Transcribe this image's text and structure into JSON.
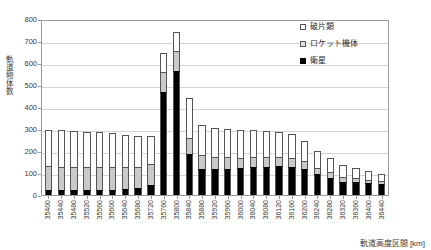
{
  "chart_data": {
    "type": "bar",
    "stacked": true,
    "title": "",
    "xlabel": "軌道高度区間 [km]",
    "ylabel": "軌道物体数",
    "ylim": [
      0,
      800
    ],
    "ytick_step": 100,
    "yticks": [
      0,
      100,
      200,
      300,
      400,
      500,
      600,
      700,
      800
    ],
    "grid": true,
    "legend_position": "top-right",
    "categories": [
      "35400",
      "35440",
      "35480",
      "35520",
      "35560",
      "35600",
      "35640",
      "35680",
      "35720",
      "35760",
      "35800",
      "35840",
      "35880",
      "35920",
      "35960",
      "36000",
      "36040",
      "36080",
      "36120",
      "36160",
      "36200",
      "36240",
      "36280",
      "36320",
      "36360",
      "36400",
      "36440"
    ],
    "series": [
      {
        "name": "衛星",
        "color": "#000000",
        "values": [
          22,
          22,
          22,
          24,
          24,
          25,
          26,
          30,
          48,
          475,
          570,
          188,
          120,
          118,
          120,
          122,
          128,
          130,
          132,
          130,
          120,
          96,
          80,
          62,
          58,
          54,
          50
        ]
      },
      {
        "name": "ロケット機体",
        "color": "#c9c9c9",
        "values": [
          110,
          108,
          108,
          106,
          104,
          104,
          104,
          100,
          96,
          92,
          90,
          76,
          62,
          58,
          54,
          50,
          46,
          44,
          42,
          40,
          36,
          30,
          24,
          20,
          18,
          16,
          14
        ]
      },
      {
        "name": "破片類",
        "color": "#ffffff",
        "values": [
          168,
          168,
          166,
          162,
          160,
          154,
          148,
          140,
          128,
          88,
          88,
          182,
          140,
          132,
          128,
          126,
          124,
          122,
          118,
          110,
          94,
          78,
          66,
          54,
          46,
          40,
          34
        ]
      }
    ],
    "totals": [
      300,
      298,
      296,
      292,
      288,
      283,
      278,
      270,
      272,
      655,
      748,
      446,
      322,
      308,
      302,
      298,
      298,
      296,
      292,
      280,
      250,
      204,
      170,
      136,
      122,
      110,
      98
    ]
  },
  "legend": {
    "items": [
      {
        "label": "破片類",
        "swatch": "debris"
      },
      {
        "label": "ロケット機体",
        "swatch": "rocket"
      },
      {
        "label": "衛星",
        "swatch": "satellite"
      }
    ]
  }
}
